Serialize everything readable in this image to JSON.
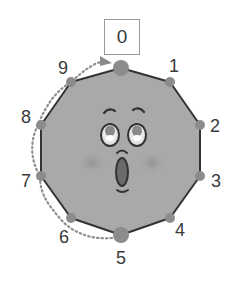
{
  "diagram": {
    "title_box": {
      "label": "0"
    },
    "vertex_labels": [
      {
        "id": 1,
        "text": "1",
        "x": 174,
        "y": 66
      },
      {
        "id": 2,
        "text": "2",
        "x": 215,
        "y": 126
      },
      {
        "id": 3,
        "text": "3",
        "x": 216,
        "y": 181
      },
      {
        "id": 4,
        "text": "4",
        "x": 180,
        "y": 230
      },
      {
        "id": 5,
        "text": "5",
        "x": 121,
        "y": 258
      },
      {
        "id": 6,
        "text": "6",
        "x": 64,
        "y": 237
      },
      {
        "id": 7,
        "text": "7",
        "x": 26,
        "y": 181
      },
      {
        "id": 8,
        "text": "8",
        "x": 26,
        "y": 117
      },
      {
        "id": 9,
        "text": "9",
        "x": 63,
        "y": 68
      }
    ],
    "shape": "decagon",
    "face_expression": "surprised",
    "path_description": "dotted arrow from vertex 5 counter-clockwise via 6,7,8,9 to vertex 0",
    "colors": {
      "body": "#a9a9a9",
      "outline": "#333333",
      "vertex": "#8c8c8c",
      "dotted_path": "#8f8f8f",
      "text": "#3a3a3a"
    }
  }
}
